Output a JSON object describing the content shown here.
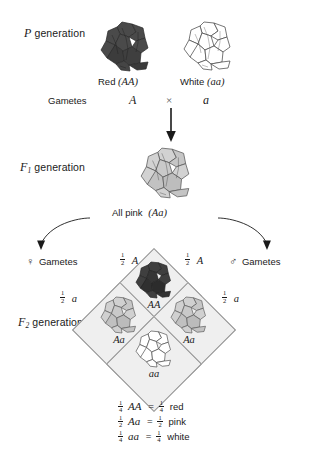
{
  "diagram": {
    "colors": {
      "red_allele_flower": "#4a4a4a",
      "pink_flower": "#c9c9c9",
      "white_flower": "#ffffff",
      "cell_fill": "#efefef",
      "line": "#8c8c8c",
      "text": "#1a1a1a"
    }
  },
  "p_generation": {
    "label_italic": "P",
    "label_text": "generation",
    "parent_left": {
      "name": "Red",
      "genotype": "(AA)",
      "flower_shade": "dark"
    },
    "parent_right": {
      "name": "White",
      "genotype": "(aa)",
      "flower_shade": "white"
    }
  },
  "gametes_row": {
    "label": "Gametes",
    "left_gamete": "A",
    "cross_symbol": "×",
    "right_gamete": "a"
  },
  "f1_generation": {
    "label_italic": "F",
    "label_sub": "1",
    "label_text": "generation",
    "offspring_caption": "All pink",
    "offspring_genotype": "(Aa)",
    "flower_shade": "pink"
  },
  "f2_generation": {
    "label_italic": "F",
    "label_sub": "2",
    "label_text": "generation",
    "female_gametes_label": "Gametes",
    "female_symbol": "♀",
    "male_gametes_label": "Gametes",
    "male_symbol": "♂",
    "gamete_headers": {
      "top_left": {
        "num": "1",
        "den": "2",
        "allele": "A"
      },
      "top_right": {
        "num": "1",
        "den": "2",
        "allele": "A"
      },
      "side_left": {
        "num": "1",
        "den": "2",
        "allele": "a"
      },
      "side_right": {
        "num": "1",
        "den": "2",
        "allele": "a"
      }
    },
    "cells": [
      {
        "position": "top",
        "genotype": "AA",
        "flower_shade": "dark"
      },
      {
        "position": "left",
        "genotype": "Aa",
        "flower_shade": "pink"
      },
      {
        "position": "right",
        "genotype": "Aa",
        "flower_shade": "pink"
      },
      {
        "position": "bottom",
        "genotype": "aa",
        "flower_shade": "white"
      }
    ]
  },
  "ratios": [
    {
      "num": "1",
      "den": "4",
      "genotype": "AA",
      "eq": "=",
      "rnum": "1",
      "rden": "4",
      "phenotype": "red"
    },
    {
      "num": "1",
      "den": "2",
      "genotype": "Aa",
      "eq": "=",
      "rnum": "1",
      "rden": "2",
      "phenotype": "pink"
    },
    {
      "num": "1",
      "den": "4",
      "genotype": "aa",
      "eq": "=",
      "rnum": "1",
      "rden": "4",
      "phenotype": "white"
    }
  ]
}
